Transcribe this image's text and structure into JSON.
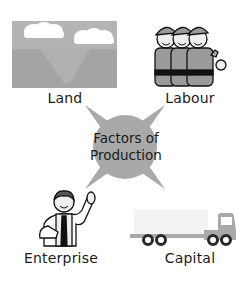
{
  "diagram": {
    "title": "Factors of Production",
    "center": {
      "line1": "Factors of",
      "line2": "Production",
      "shape": "four-point-star-with-circle",
      "color": "#a9a9a9"
    },
    "factors": [
      {
        "id": "land",
        "label": "Land",
        "icon": "landscape-icon",
        "position": "top-left"
      },
      {
        "id": "labour",
        "label": "Labour",
        "icon": "workers-icon",
        "position": "top-right"
      },
      {
        "id": "enterprise",
        "label": "Enterprise",
        "icon": "businessman-icon",
        "position": "bottom-left"
      },
      {
        "id": "capital",
        "label": "Capital",
        "icon": "truck-icon",
        "position": "bottom-right"
      }
    ],
    "colors": {
      "background": "#ffffff",
      "icon_gray": "#9a9a9a",
      "sky_gray": "#b4b4b4",
      "ground_gray": "#a4a4a4",
      "text": "#1a1a1a"
    }
  }
}
